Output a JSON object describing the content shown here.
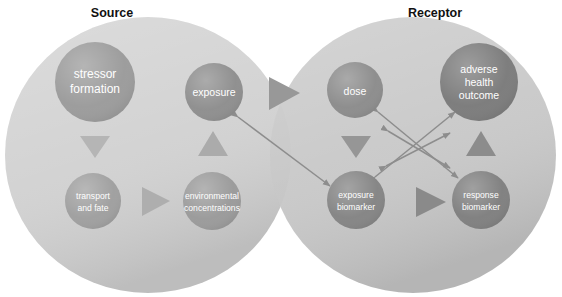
{
  "figure": {
    "title_source": "Source",
    "title_receptor": "Receptor",
    "background_color": "#ffffff"
  },
  "palette": {
    "ellipse_source": "#d2d2d2",
    "ellipse_receptor": "#c6c6c6",
    "ellipse_overlap": "#bcbcbc",
    "node_light": "#a3a3a3",
    "node_mid": "#8f8f8f",
    "node_dark": "#7c7c7c",
    "triangle_light": "#b9b9b9",
    "triangle_mid": "#a0a0a0",
    "triangle_dark": "#8a8a8a",
    "arrow_line": "#8d8d8d",
    "label_text": "#ffffff",
    "title_text": "#111111"
  },
  "groups": [
    {
      "id": "source",
      "label": "Source",
      "label_x": 112,
      "label_y": 17,
      "cx": 148,
      "cy": 155,
      "rx": 143,
      "ry": 138,
      "fill": "#d2d2d2"
    },
    {
      "id": "receptor",
      "label": "Receptor",
      "label_x": 435,
      "label_y": 17,
      "cx": 413,
      "cy": 155,
      "rx": 143,
      "ry": 138,
      "fill": "#c6c6c6"
    }
  ],
  "nodes": [
    {
      "id": "stressor-formation",
      "label_lines": [
        "stressor",
        "formation"
      ],
      "cx": 95,
      "cy": 82,
      "r": 40,
      "fill": "#9b9b9b",
      "size": "big",
      "group": "source"
    },
    {
      "id": "exposure",
      "label_lines": [
        "exposure"
      ],
      "cx": 214,
      "cy": 92,
      "r": 29,
      "fill": "#8e8e8e",
      "size": "mid",
      "group": "source"
    },
    {
      "id": "transport-and-fate",
      "label_lines": [
        "transport",
        "and fate"
      ],
      "cx": 93,
      "cy": 201,
      "r": 28,
      "fill": "#9f9f9f",
      "size": "sm",
      "group": "source"
    },
    {
      "id": "environmental-concentrations",
      "label_lines": [
        "environmental",
        "concentrations"
      ],
      "cx": 212,
      "cy": 201,
      "r": 29,
      "fill": "#9a9a9a",
      "size": "sm",
      "group": "source"
    },
    {
      "id": "dose",
      "label_lines": [
        "dose"
      ],
      "cx": 355,
      "cy": 90,
      "r": 28,
      "fill": "#8c8c8c",
      "size": "mid",
      "group": "receptor"
    },
    {
      "id": "adverse-health-outcome",
      "label_lines": [
        "adverse",
        "health",
        "outcome"
      ],
      "cx": 479,
      "cy": 82,
      "r": 39,
      "fill": "#7b7b7b",
      "size": "mid",
      "group": "receptor"
    },
    {
      "id": "exposure-biomarker",
      "label_lines": [
        "exposure",
        "biomarker"
      ],
      "cx": 356,
      "cy": 200,
      "r": 29,
      "fill": "#848484",
      "size": "sm",
      "group": "receptor"
    },
    {
      "id": "response-biomarker",
      "label_lines": [
        "response",
        "biomarker"
      ],
      "cx": 481,
      "cy": 200,
      "r": 29,
      "fill": "#7f7f7f",
      "size": "sm",
      "group": "receptor"
    }
  ],
  "flow_triangles": [
    {
      "id": "stressor-to-transport",
      "direction": "down",
      "cx": 95,
      "cy": 143,
      "size": 15,
      "fill": "#b5b5b5"
    },
    {
      "id": "environmental-to-exposure",
      "direction": "up",
      "cx": 213,
      "cy": 145,
      "size": 15,
      "fill": "#ababab"
    },
    {
      "id": "transport-to-environmental",
      "direction": "right",
      "cx": 153,
      "cy": 201,
      "size": 16,
      "fill": "#aeaeae"
    },
    {
      "id": "exposure-to-dose",
      "direction": "right",
      "cx": 283,
      "cy": 93,
      "size": 17,
      "fill": "#989898"
    },
    {
      "id": "dose-to-exposure-biomarker",
      "direction": "down",
      "cx": 356,
      "cy": 143,
      "size": 15,
      "fill": "#969696"
    },
    {
      "id": "response-biomarker-to-adverse",
      "direction": "up",
      "cx": 481,
      "cy": 145,
      "size": 15,
      "fill": "#8c8c8c"
    },
    {
      "id": "exposure-biomarker-to-response-biomarker",
      "direction": "right",
      "cx": 428,
      "cy": 202,
      "size": 17,
      "fill": "#8a8a8a"
    }
  ],
  "link_arrows": [
    {
      "id": "exposure-to-exposure-biomarker",
      "x1": 238,
      "y1": 117,
      "x2": 330,
      "y2": 186,
      "double": true
    },
    {
      "id": "exposure-biomarker-to-adverse-health-outcome",
      "x1": 375,
      "y1": 177,
      "x2": 455,
      "y2": 112,
      "double": true
    },
    {
      "id": "dose-to-response-biomarker",
      "x1": 378,
      "y1": 112,
      "x2": 458,
      "y2": 178,
      "double": true
    },
    {
      "id": "dose-to-adverse-health-outcome-cross",
      "x1": 385,
      "y1": 150,
      "x2": 452,
      "y2": 150,
      "double": true
    },
    {
      "id": "exposure-biomarker-cross-link",
      "x1": 388,
      "y1": 131,
      "x2": 450,
      "y2": 168,
      "double": true
    }
  ]
}
